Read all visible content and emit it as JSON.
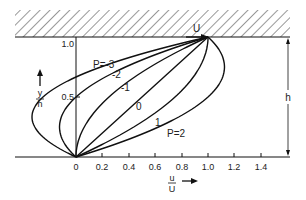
{
  "diagram": {
    "plate_label": "U",
    "height_label": "h",
    "y_axis": {
      "numerator": "y",
      "denominator": "h",
      "ticks": [
        "1.0",
        "0.5"
      ]
    },
    "x_axis": {
      "numerator": "u",
      "denominator": "U",
      "ticks": [
        "0",
        "0.2",
        "0.4",
        "0.6",
        "0.8",
        "1.0",
        "1.2",
        "1.4"
      ]
    },
    "curve_labels": {
      "p_minus3": "P=-3",
      "p_minus2": "-2",
      "p_minus1": "-1",
      "p_0": "0",
      "p_1": "1",
      "p_2": "P=2"
    },
    "profile_formula": "u/U = y/h + P (y/h)(1 - y/h)",
    "pressure_params": [
      -3,
      -2,
      -1,
      0,
      1,
      2
    ],
    "colors": {
      "line": "#111111",
      "background": "#ffffff"
    }
  }
}
